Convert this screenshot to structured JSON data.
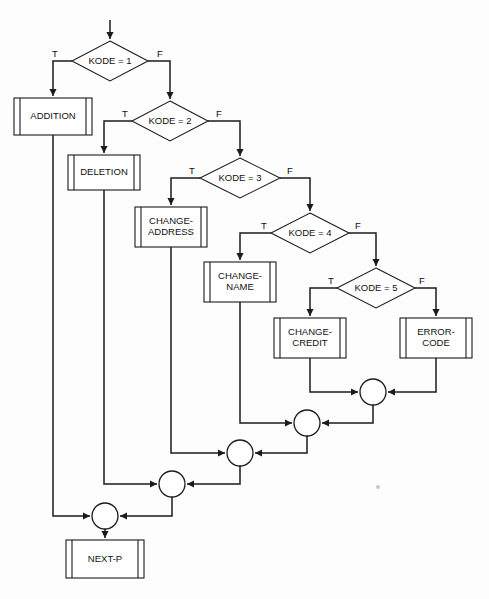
{
  "diagram": {
    "type": "flowchart",
    "background_color": "#fdfdfd",
    "line_color": "#1b1b1b",
    "shape_fill": "#ffffff",
    "entry": {
      "label": "",
      "arrow_from": [
        110,
        22
      ],
      "arrow_to": [
        110,
        41
      ]
    },
    "decisions": [
      {
        "id": "kode1",
        "label": "KODE = 1",
        "cx": 110,
        "cy": 61,
        "rx": 38,
        "ry": 20,
        "true_label": "T",
        "false_label": "F",
        "true_label_pos": [
          55,
          54
        ],
        "false_label_pos": [
          160,
          54
        ],
        "true_target": "addition",
        "false_target": "kode2"
      },
      {
        "id": "kode2",
        "label": "KODE = 2",
        "cx": 170,
        "cy": 121,
        "rx": 38,
        "ry": 20,
        "true_label": "T",
        "false_label": "F",
        "true_label_pos": [
          125,
          114
        ],
        "false_label_pos": [
          219,
          114
        ],
        "true_target": "deletion",
        "false_target": "kode3"
      },
      {
        "id": "kode3",
        "label": "KODE = 3",
        "cx": 240,
        "cy": 178,
        "rx": 40,
        "ry": 20,
        "true_label": "T",
        "false_label": "F",
        "true_label_pos": [
          192,
          171
        ],
        "false_label_pos": [
          290,
          171
        ],
        "true_target": "change-address",
        "false_target": "kode4"
      },
      {
        "id": "kode4",
        "label": "KODE = 4",
        "cx": 310,
        "cy": 233,
        "rx": 39,
        "ry": 20,
        "true_label": "T",
        "false_label": "F",
        "true_label_pos": [
          264,
          226
        ],
        "false_label_pos": [
          358,
          226
        ],
        "true_target": "change-name",
        "false_target": "kode5"
      },
      {
        "id": "kode5",
        "label": "KODE = 5",
        "cx": 376,
        "cy": 288,
        "rx": 39,
        "ry": 20,
        "true_label": "T",
        "false_label": "F",
        "true_label_pos": [
          331,
          281
        ],
        "false_label_pos": [
          422,
          281
        ],
        "true_target": "change-credit",
        "false_target": "error-code"
      }
    ],
    "processes": [
      {
        "id": "addition",
        "label": "ADDITION",
        "lines": [
          "ADDITION"
        ],
        "x": 14,
        "y": 98,
        "w": 78,
        "h": 37,
        "shape": "predefined-process"
      },
      {
        "id": "deletion",
        "label": "DELETION",
        "lines": [
          "DELETION"
        ],
        "x": 68,
        "y": 155,
        "w": 72,
        "h": 35,
        "shape": "predefined-process"
      },
      {
        "id": "change-address",
        "label": "CHANGE-ADDRESS",
        "lines": [
          "CHANGE-",
          "ADDRESS"
        ],
        "x": 135,
        "y": 207,
        "w": 72,
        "h": 40,
        "shape": "predefined-process"
      },
      {
        "id": "change-name",
        "label": "CHANGE-NAME",
        "lines": [
          "CHANGE-",
          "NAME"
        ],
        "x": 204,
        "y": 262,
        "w": 72,
        "h": 40,
        "shape": "predefined-process"
      },
      {
        "id": "change-credit",
        "label": "CHANGE-CREDIT",
        "lines": [
          "CHANGE-",
          "CREDIT"
        ],
        "x": 274,
        "y": 318,
        "w": 72,
        "h": 40,
        "shape": "predefined-process"
      },
      {
        "id": "error-code",
        "label": "ERROR-CODE",
        "lines": [
          "ERROR-",
          "CODE"
        ],
        "x": 400,
        "y": 318,
        "w": 72,
        "h": 40,
        "shape": "predefined-process"
      },
      {
        "id": "next-p",
        "label": "NEXT-P",
        "lines": [
          "NEXT-P"
        ],
        "x": 66,
        "y": 540,
        "w": 78,
        "h": 38,
        "shape": "predefined-process"
      }
    ],
    "connectors": [
      {
        "id": "merge-5",
        "cx": 373,
        "cy": 392,
        "r": 13
      },
      {
        "id": "merge-4",
        "cx": 307,
        "cy": 423,
        "r": 13
      },
      {
        "id": "merge-3",
        "cx": 240,
        "cy": 453,
        "r": 13
      },
      {
        "id": "merge-2",
        "cx": 172,
        "cy": 484,
        "r": 13
      },
      {
        "id": "merge-1",
        "cx": 105,
        "cy": 516,
        "r": 13
      }
    ],
    "edges": [
      {
        "id": "entry-to-kode1",
        "path": "M 110 20 L 110 39"
      },
      {
        "id": "kode1-true-to-addition",
        "path": "M 72 61 L 53 61 L 53 80 L 53 96"
      },
      {
        "id": "kode1-false-to-kode2",
        "path": "M 148 61 L 170 61 L 170 80 L 170 99"
      },
      {
        "id": "kode2-true-to-deletion",
        "path": "M 132 121 L 104 121 L 104 140 L 104 153"
      },
      {
        "id": "kode2-false-to-kode3",
        "path": "M 208 121 L 240 121 L 240 140 L 240 156"
      },
      {
        "id": "kode3-true-to-change-address",
        "path": "M 200 178 L 171 178 L 171 196 L 171 205"
      },
      {
        "id": "kode3-false-to-kode4",
        "path": "M 280 178 L 310 178 L 310 196 L 310 211"
      },
      {
        "id": "kode4-true-to-change-name",
        "path": "M 271 233 L 240 233 L 240 250 L 240 260"
      },
      {
        "id": "kode4-false-to-kode5",
        "path": "M 349 233 L 376 233 L 376 250 L 376 266"
      },
      {
        "id": "kode5-true-to-change-credit",
        "path": "M 337 288 L 310 288 L 310 305 L 310 316"
      },
      {
        "id": "kode5-false-to-error-code",
        "path": "M 415 288 L 436 288 L 436 305 L 436 316"
      },
      {
        "id": "change-credit-to-merge5",
        "path": "M 310 358 L 310 392 L 358 392"
      },
      {
        "id": "error-code-to-merge5",
        "path": "M 436 358 L 436 392 L 388 392"
      },
      {
        "id": "merge5-to-merge4",
        "path": "M 373 405 L 373 423 L 322 423"
      },
      {
        "id": "change-name-to-merge4",
        "path": "M 240 302 L 240 423 L 292 423"
      },
      {
        "id": "merge4-to-merge3",
        "path": "M 307 436 L 307 453 L 255 453"
      },
      {
        "id": "change-address-to-merge3",
        "path": "M 171 247 L 171 453 L 225 453"
      },
      {
        "id": "merge3-to-merge2",
        "path": "M 240 466 L 240 484 L 187 484"
      },
      {
        "id": "deletion-to-merge2",
        "path": "M 104 190 L 104 484 L 157 484"
      },
      {
        "id": "merge2-to-merge1",
        "path": "M 172 497 L 172 516 L 120 516"
      },
      {
        "id": "addition-to-merge1",
        "path": "M 53 135 L 53 516 L 90 516"
      },
      {
        "id": "merge1-to-next-p",
        "path": "M 105 529 L 105 538"
      }
    ],
    "arrowheads": [
      {
        "at": [
          110,
          39
        ],
        "dir": "down"
      },
      {
        "at": [
          53,
          96
        ],
        "dir": "down"
      },
      {
        "at": [
          170,
          99
        ],
        "dir": "down"
      },
      {
        "at": [
          104,
          153
        ],
        "dir": "down"
      },
      {
        "at": [
          240,
          156
        ],
        "dir": "down"
      },
      {
        "at": [
          171,
          205
        ],
        "dir": "down"
      },
      {
        "at": [
          310,
          211
        ],
        "dir": "down"
      },
      {
        "at": [
          240,
          260
        ],
        "dir": "down"
      },
      {
        "at": [
          376,
          266
        ],
        "dir": "down"
      },
      {
        "at": [
          310,
          316
        ],
        "dir": "down"
      },
      {
        "at": [
          436,
          316
        ],
        "dir": "down"
      },
      {
        "at": [
          358,
          392
        ],
        "dir": "right"
      },
      {
        "at": [
          388,
          392
        ],
        "dir": "left"
      },
      {
        "at": [
          292,
          423
        ],
        "dir": "right"
      },
      {
        "at": [
          322,
          423
        ],
        "dir": "left"
      },
      {
        "at": [
          225,
          453
        ],
        "dir": "right"
      },
      {
        "at": [
          255,
          453
        ],
        "dir": "left"
      },
      {
        "at": [
          157,
          484
        ],
        "dir": "right"
      },
      {
        "at": [
          187,
          484
        ],
        "dir": "left"
      },
      {
        "at": [
          90,
          516
        ],
        "dir": "right"
      },
      {
        "at": [
          120,
          516
        ],
        "dir": "left"
      },
      {
        "at": [
          105,
          538
        ],
        "dir": "down"
      }
    ],
    "artifact": {
      "cx": 378,
      "cy": 487,
      "r": 2
    }
  }
}
